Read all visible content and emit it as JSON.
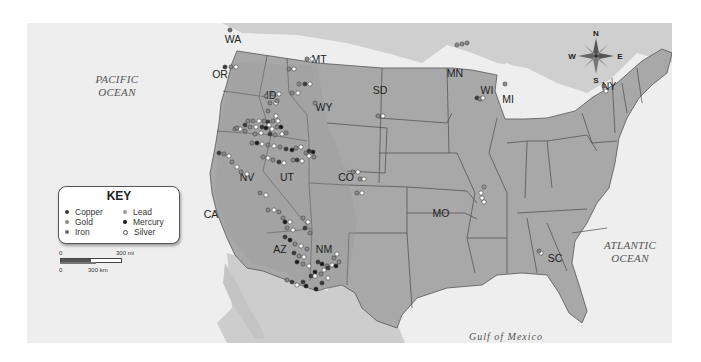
{
  "map": {
    "oceans": [
      {
        "id": "pacific",
        "lines": [
          "PACIFIC",
          "OCEAN"
        ]
      },
      {
        "id": "atlantic",
        "lines": [
          "ATLANTIC",
          "OCEAN"
        ]
      }
    ],
    "gulf_label": "Gulf  of  Mexico",
    "state_labels": [
      "WA",
      "OR",
      "ID",
      "MT",
      "WY",
      "SD",
      "MN",
      "WI",
      "MI",
      "NY",
      "CA",
      "NV",
      "UT",
      "CO",
      "MO",
      "AZ",
      "NM",
      "SC"
    ],
    "colors": {
      "land": "#a9a9a9",
      "land_other": "#c8c8c8",
      "water": "#eeeeee",
      "border": "#4a4a4a",
      "copper": "#3a3a3a",
      "gold": "#8a8a8a",
      "iron": "#6e6e6e",
      "lead": "#9a9a9a",
      "mercury": "#1a1a1a",
      "silver": "#ffffff"
    }
  },
  "key": {
    "title": "KEY",
    "items": [
      {
        "label": "Copper",
        "mineral": "copper"
      },
      {
        "label": "Gold",
        "mineral": "gold"
      },
      {
        "label": "Iron",
        "mineral": "iron"
      },
      {
        "label": "Lead",
        "mineral": "lead"
      },
      {
        "label": "Mercury",
        "mineral": "mercury"
      },
      {
        "label": "Silver",
        "mineral": "silver"
      }
    ]
  },
  "scale": {
    "top_left": "0",
    "top_right": "300 mi",
    "bottom_left": "0",
    "bottom_right": "300 km"
  },
  "compass": {
    "n": "N",
    "s": "S",
    "e": "E",
    "w": "W"
  }
}
